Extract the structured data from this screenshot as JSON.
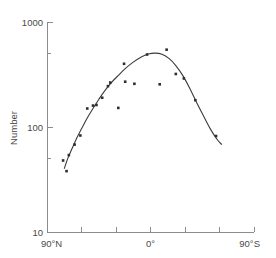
{
  "chart_data": {
    "type": "scatter",
    "title": "",
    "subtitle": "",
    "xlabel": "",
    "ylabel": "Number",
    "yscale": "log",
    "ylim": [
      10,
      1000
    ],
    "xlim": [
      90,
      -90
    ],
    "grid": false,
    "legend": null,
    "y_tick_labels": [
      "1000",
      "100",
      "10"
    ],
    "y_tick_values": [
      1000,
      100,
      10
    ],
    "y_minor_tick_values": [
      500,
      50
    ],
    "x_tick_labels": [
      "90°N",
      "0°",
      "90°S"
    ],
    "x_labeled_tick_values": [
      90,
      0,
      -90
    ],
    "x_tick_values": [
      90,
      60,
      30,
      0,
      -30,
      -60,
      -90
    ],
    "x_axis_note": "Latitude from 90°N on the left through 0° (equator) to 90°S on the right",
    "series": [
      {
        "name": "Observed number",
        "marker": "filled-square",
        "points": [
          {
            "latitude": 76,
            "number": 48
          },
          {
            "latitude": 73,
            "number": 38
          },
          {
            "latitude": 71,
            "number": 54
          },
          {
            "latitude": 66,
            "number": 68
          },
          {
            "latitude": 61,
            "number": 83
          },
          {
            "latitude": 55,
            "number": 150
          },
          {
            "latitude": 50,
            "number": 160
          },
          {
            "latitude": 47,
            "number": 162
          },
          {
            "latitude": 42,
            "number": 190
          },
          {
            "latitude": 37,
            "number": 245
          },
          {
            "latitude": 35,
            "number": 265
          },
          {
            "latitude": 28,
            "number": 152
          },
          {
            "latitude": 23,
            "number": 400
          },
          {
            "latitude": 22,
            "number": 270
          },
          {
            "latitude": 14,
            "number": 258
          },
          {
            "latitude": 3,
            "number": 490
          },
          {
            "latitude": -8,
            "number": 255
          },
          {
            "latitude": -14,
            "number": 545
          },
          {
            "latitude": -22,
            "number": 320
          },
          {
            "latitude": -29,
            "number": 290
          },
          {
            "latitude": -39,
            "number": 180
          },
          {
            "latitude": -57,
            "number": 82
          }
        ]
      }
    ],
    "fit_curve": {
      "name": "Fitted trend",
      "points": [
        {
          "latitude": 75,
          "number": 40
        },
        {
          "latitude": 72,
          "number": 50
        },
        {
          "latitude": 68,
          "number": 63
        },
        {
          "latitude": 64,
          "number": 79
        },
        {
          "latitude": 60,
          "number": 96
        },
        {
          "latitude": 55,
          "number": 122
        },
        {
          "latitude": 50,
          "number": 150
        },
        {
          "latitude": 45,
          "number": 183
        },
        {
          "latitude": 40,
          "number": 220
        },
        {
          "latitude": 34,
          "number": 265
        },
        {
          "latitude": 28,
          "number": 310
        },
        {
          "latitude": 22,
          "number": 360
        },
        {
          "latitude": 15,
          "number": 415
        },
        {
          "latitude": 8,
          "number": 465
        },
        {
          "latitude": 2,
          "number": 495
        },
        {
          "latitude": -4,
          "number": 505
        },
        {
          "latitude": -10,
          "number": 492
        },
        {
          "latitude": -16,
          "number": 450
        },
        {
          "latitude": -22,
          "number": 385
        },
        {
          "latitude": -28,
          "number": 310
        },
        {
          "latitude": -34,
          "number": 235
        },
        {
          "latitude": -40,
          "number": 172
        },
        {
          "latitude": -46,
          "number": 128
        },
        {
          "latitude": -52,
          "number": 96
        },
        {
          "latitude": -58,
          "number": 76
        },
        {
          "latitude": -62,
          "number": 68
        }
      ]
    }
  }
}
